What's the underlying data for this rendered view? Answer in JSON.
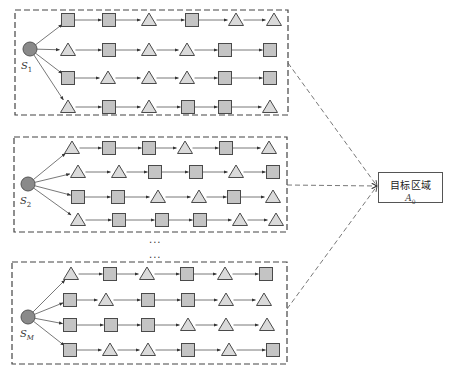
{
  "colors": {
    "square_fill": "#c4c4c4",
    "triangle_fill": "#dadada",
    "node_stroke": "#4a4a4a",
    "source_fill": "#8a8a8a",
    "edge": "#555555",
    "dashed": "#555555"
  },
  "target": {
    "label": "目标区域",
    "symbol": "A",
    "subscript": "0",
    "box": {
      "x": 378,
      "y": 172,
      "w": 65,
      "h": 31
    },
    "arrow_tip": {
      "x": 377,
      "y": 186
    }
  },
  "ellipses": [
    {
      "text": "...",
      "x": 149,
      "y": 237
    },
    {
      "text": "...",
      "x": 149,
      "y": 252
    }
  ],
  "blocks": [
    {
      "id": "S1",
      "label_main": "S",
      "label_sub": "1",
      "frame": {
        "x": 15,
        "y": 10,
        "w": 273,
        "h": 105
      },
      "source": {
        "x": 30,
        "y": 49,
        "r": 7
      },
      "label_pos": {
        "x": 21,
        "y": 60
      },
      "exit": {
        "x": 288,
        "y": 63
      },
      "rows": [
        {
          "y": 20,
          "xs": [
            68,
            109,
            149,
            192,
            236,
            274
          ],
          "nodes": [
            "square",
            "square",
            "triangle",
            "square",
            "triangle",
            "triangle"
          ]
        },
        {
          "y": 50,
          "xs": [
            68,
            109,
            149,
            187,
            225,
            270
          ],
          "nodes": [
            "triangle",
            "square",
            "triangle",
            "triangle",
            "square",
            "square"
          ]
        },
        {
          "y": 78,
          "xs": [
            68,
            108,
            149,
            187,
            225,
            270
          ],
          "nodes": [
            "square",
            "triangle",
            "triangle",
            "triangle",
            "square",
            "square"
          ]
        },
        {
          "y": 107,
          "xs": [
            68,
            109,
            149,
            188,
            225,
            270
          ],
          "nodes": [
            "triangle",
            "square",
            "triangle",
            "square",
            "square",
            "triangle"
          ]
        }
      ]
    },
    {
      "id": "S2",
      "label_main": "S",
      "label_sub": "2",
      "frame": {
        "x": 14,
        "y": 137,
        "w": 273,
        "h": 95
      },
      "source": {
        "x": 28,
        "y": 184,
        "r": 7
      },
      "label_pos": {
        "x": 20,
        "y": 195
      },
      "exit": {
        "x": 287,
        "y": 185
      },
      "rows": [
        {
          "y": 148,
          "xs": [
            72,
            109,
            149,
            185,
            226,
            269
          ],
          "nodes": [
            "triangle",
            "square",
            "square",
            "triangle",
            "square",
            "triangle"
          ]
        },
        {
          "y": 172,
          "xs": [
            78,
            119,
            155,
            196,
            236,
            273
          ],
          "nodes": [
            "triangle",
            "triangle",
            "square",
            "square",
            "triangle",
            "square"
          ]
        },
        {
          "y": 197,
          "xs": [
            78,
            118,
            158,
            199,
            234,
            273
          ],
          "nodes": [
            "square",
            "square",
            "triangle",
            "triangle",
            "square",
            "triangle"
          ]
        },
        {
          "y": 220,
          "xs": [
            78,
            119,
            162,
            200,
            240,
            276
          ],
          "nodes": [
            "triangle",
            "square",
            "square",
            "square",
            "triangle",
            "triangle"
          ]
        }
      ]
    },
    {
      "id": "SM",
      "label_main": "S",
      "label_sub": "M",
      "frame": {
        "x": 12,
        "y": 262,
        "w": 275,
        "h": 102
      },
      "source": {
        "x": 28,
        "y": 317,
        "r": 7
      },
      "label_pos": {
        "x": 20,
        "y": 328
      },
      "exit": {
        "x": 287,
        "y": 309
      },
      "rows": [
        {
          "y": 274,
          "xs": [
            71,
            110,
            147,
            187,
            225,
            266
          ],
          "nodes": [
            "triangle",
            "square",
            "triangle",
            "square",
            "triangle",
            "square"
          ]
        },
        {
          "y": 300,
          "xs": [
            70,
            106,
            148,
            188,
            226,
            264
          ],
          "nodes": [
            "square",
            "triangle",
            "square",
            "square",
            "triangle",
            "triangle"
          ]
        },
        {
          "y": 325,
          "xs": [
            70,
            111,
            148,
            188,
            226,
            267
          ],
          "nodes": [
            "square",
            "square",
            "square",
            "triangle",
            "triangle",
            "triangle"
          ]
        },
        {
          "y": 350,
          "xs": [
            70,
            110,
            148,
            188,
            229,
            273
          ],
          "nodes": [
            "square",
            "triangle",
            "triangle",
            "square",
            "triangle",
            "square"
          ]
        }
      ]
    }
  ]
}
